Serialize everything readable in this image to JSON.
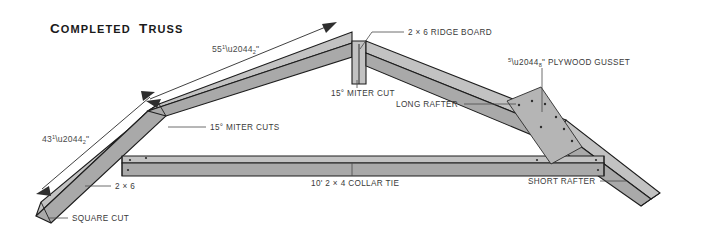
{
  "figure": {
    "title": "Completed Truss",
    "title_plain": "COMPLETED TRUSS",
    "background_color": "#ffffff",
    "wood_light_color": "#c2c2c2",
    "wood_mid_color": "#a9a9a9",
    "wood_dark_color": "#8f8f8f",
    "line_color": "#1d1d1d",
    "label_color": "#3a3a3a"
  },
  "dimensions": [
    {
      "id": "long-rafter-length",
      "value": "55",
      "fraction_numerator": "1",
      "fraction_denominator": "2",
      "unit": "\"",
      "full": "55 1/2\"",
      "describes": "long rafter overall length"
    },
    {
      "id": "short-rafter-length",
      "value": "43",
      "fraction_numerator": "1",
      "fraction_denominator": "2",
      "unit": "\"",
      "full": "43 1/2\"",
      "describes": "short rafter overall length"
    }
  ],
  "callouts": [
    {
      "id": "ridge-board",
      "text": "2 × 6 RIDGE BOARD"
    },
    {
      "id": "miter-cut-ridge",
      "text": "15° MITER CUT"
    },
    {
      "id": "miter-cuts-left",
      "text": "15° MITER CUTS"
    },
    {
      "id": "long-rafter",
      "text": "LONG RAFTER"
    },
    {
      "id": "short-rafter",
      "text": "SHORT RAFTER"
    },
    {
      "id": "collar-tie",
      "text": "10' 2 × 4 COLLAR TIE"
    },
    {
      "id": "lumber-2x6",
      "text": "2 × 6"
    },
    {
      "id": "square-cut",
      "text": "SQUARE CUT"
    },
    {
      "id": "plywood-gusset",
      "text": "⅝\" PLYWOOD GUSSET",
      "prefix_fraction": "5/8",
      "suffix": "\" PLYWOOD GUSSET"
    }
  ]
}
